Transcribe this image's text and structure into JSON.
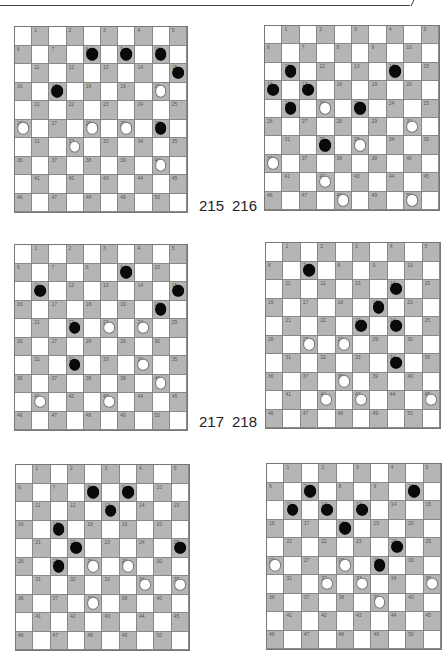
{
  "page": {
    "top_rule": true
  },
  "diagrams": [
    {
      "number": "215",
      "x": 14,
      "y": 26,
      "w": 174,
      "h": 187,
      "label_x": 199,
      "label_y": 197,
      "black": [
        8,
        9,
        10,
        15,
        17,
        30
      ],
      "white": [
        20,
        26,
        28,
        29,
        32,
        40
      ]
    },
    {
      "number": "216",
      "x": 264,
      "y": 25,
      "w": 176,
      "h": 186,
      "label_x": 232,
      "label_y": 197,
      "black": [
        11,
        14,
        16,
        17,
        21,
        23,
        32
      ],
      "white": [
        22,
        30,
        33,
        36,
        42,
        48,
        50
      ]
    },
    {
      "number": "217",
      "x": 14,
      "y": 244,
      "w": 174,
      "h": 187,
      "label_x": 199,
      "label_y": 413,
      "black": [
        9,
        11,
        15,
        20,
        22,
        32
      ],
      "white": [
        23,
        24,
        34,
        40,
        41,
        43
      ]
    },
    {
      "number": "218",
      "x": 265,
      "y": 242,
      "w": 176,
      "h": 187,
      "label_x": 232,
      "label_y": 413,
      "black": [
        7,
        14,
        19,
        23,
        24,
        34
      ],
      "white": [
        27,
        28,
        38,
        42,
        43,
        45
      ]
    },
    {
      "number": "",
      "x": 15,
      "y": 464,
      "w": 175,
      "h": 187,
      "label_x": 0,
      "label_y": 0,
      "black": [
        8,
        9,
        13,
        17,
        22,
        25,
        27
      ],
      "white": [
        28,
        29,
        34,
        35,
        38
      ]
    },
    {
      "number": "",
      "x": 266,
      "y": 463,
      "w": 176,
      "h": 187,
      "label_x": 0,
      "label_y": 0,
      "black": [
        7,
        10,
        11,
        12,
        13,
        18,
        24,
        29
      ],
      "white": [
        26,
        28,
        32,
        33,
        35,
        39
      ]
    }
  ],
  "colors": {
    "dark_square": "#b5b5b5",
    "light_square": "#ffffff",
    "black_piece": "#0a0a0a",
    "white_piece": "#ffffff"
  }
}
